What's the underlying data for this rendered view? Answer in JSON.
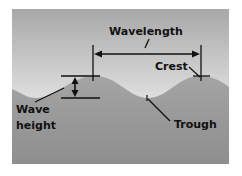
{
  "diagram": {
    "labels": {
      "wavelength": "Wavelength",
      "crest": "Crest",
      "trough": "Trough",
      "wave_height_line1": "Wave",
      "wave_height_line2": "height"
    },
    "colors": {
      "sky_top": "#a9a9a9",
      "sky_bottom": "#f2f2f2",
      "water_top": "#a2a2a2",
      "water_bottom": "#8f8f8f",
      "line": "#111111",
      "background": "#ffffff"
    }
  }
}
